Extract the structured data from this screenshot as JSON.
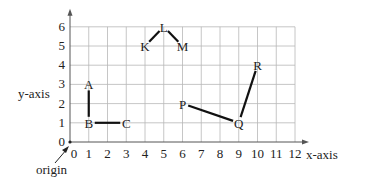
{
  "chart_data": {
    "type": "scatter",
    "title": "",
    "xlabel": "x-axis",
    "ylabel": "y-axis",
    "xlim": [
      0,
      12
    ],
    "ylim": [
      0,
      6
    ],
    "grid": true,
    "x_ticks": [
      "0",
      "1",
      "2",
      "3",
      "4",
      "5",
      "6",
      "7",
      "8",
      "9",
      "10",
      "11",
      "12"
    ],
    "y_ticks": [
      "0",
      "1",
      "2",
      "3",
      "4",
      "5",
      "6"
    ],
    "points": [
      {
        "label": "A",
        "x": 1,
        "y": 3
      },
      {
        "label": "B",
        "x": 1,
        "y": 1
      },
      {
        "label": "C",
        "x": 3,
        "y": 1
      },
      {
        "label": "K",
        "x": 4,
        "y": 5
      },
      {
        "label": "L",
        "x": 5,
        "y": 6
      },
      {
        "label": "M",
        "x": 6,
        "y": 5
      },
      {
        "label": "P",
        "x": 6,
        "y": 2
      },
      {
        "label": "Q",
        "x": 9,
        "y": 1
      },
      {
        "label": "R",
        "x": 10,
        "y": 4
      }
    ],
    "segments": [
      [
        "A",
        "B"
      ],
      [
        "B",
        "C"
      ],
      [
        "K",
        "L"
      ],
      [
        "L",
        "M"
      ],
      [
        "P",
        "Q"
      ],
      [
        "Q",
        "R"
      ]
    ],
    "annotations": [
      {
        "text": "origin",
        "points_to": [
          0,
          0
        ]
      }
    ]
  },
  "labels": {
    "x_axis": "x-axis",
    "y_axis": "y-axis",
    "origin": "origin"
  }
}
